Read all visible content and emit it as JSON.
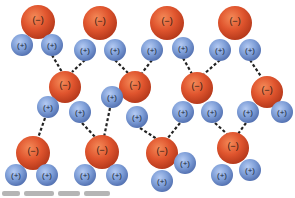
{
  "figure": {
    "labels": {
      "oxygen": "(−)",
      "hydrogen": "(+)"
    },
    "colors": {
      "oxygen_fill": "#e0552e",
      "oxygen_highlight": "#f27a4a",
      "oxygen_shade": "#b73a1c",
      "hydrogen_fill": "#7f9fd8",
      "hydrogen_highlight": "#aac2ee",
      "hydrogen_shade": "#5573b3",
      "bond": "#222222",
      "background": "#ffffff"
    },
    "molecules": [
      {
        "id": "top-1",
        "O": [
          38,
          22,
          17
        ],
        "H": [
          [
            22,
            45,
            11
          ],
          [
            52,
            45,
            11
          ]
        ]
      },
      {
        "id": "top-2",
        "O": [
          100,
          23,
          17
        ],
        "H": [
          [
            85,
            50,
            11
          ],
          [
            115,
            50,
            11
          ]
        ]
      },
      {
        "id": "top-3",
        "O": [
          167,
          23,
          17
        ],
        "H": [
          [
            152,
            50,
            11
          ],
          [
            183,
            48,
            11
          ]
        ]
      },
      {
        "id": "top-4",
        "O": [
          235,
          23,
          17
        ],
        "H": [
          [
            220,
            50,
            11
          ],
          [
            250,
            50,
            11
          ]
        ]
      },
      {
        "id": "mid-1",
        "O": [
          65,
          87,
          16
        ],
        "H": [
          [
            48,
            107,
            11
          ],
          [
            80,
            112,
            11
          ]
        ]
      },
      {
        "id": "mid-2",
        "O": [
          135,
          87,
          16
        ],
        "H": [
          [
            112,
            97,
            11
          ],
          [
            137,
            117,
            11
          ]
        ]
      },
      {
        "id": "mid-3",
        "O": [
          197,
          88,
          16
        ],
        "H": [
          [
            183,
            112,
            11
          ],
          [
            212,
            112,
            11
          ]
        ]
      },
      {
        "id": "mid-4",
        "O": [
          267,
          92,
          16
        ],
        "H": [
          [
            248,
            112,
            11
          ],
          [
            282,
            112,
            11
          ]
        ]
      },
      {
        "id": "bot-1",
        "O": [
          33,
          153,
          17
        ],
        "H": [
          [
            16,
            175,
            11
          ],
          [
            47,
            175,
            11
          ]
        ]
      },
      {
        "id": "bot-2",
        "O": [
          102,
          152,
          17
        ],
        "H": [
          [
            85,
            175,
            11
          ],
          [
            117,
            175,
            11
          ]
        ]
      },
      {
        "id": "bot-3",
        "O": [
          162,
          153,
          16
        ],
        "H": [
          [
            185,
            163,
            11
          ],
          [
            162,
            181,
            11
          ]
        ]
      },
      {
        "id": "bot-4",
        "O": [
          233,
          148,
          16
        ],
        "H": [
          [
            222,
            175,
            11
          ],
          [
            250,
            170,
            11
          ]
        ]
      }
    ],
    "hydrogen_bonds": [
      [
        52,
        55,
        62,
        72
      ],
      [
        85,
        60,
        72,
        72
      ],
      [
        115,
        60,
        128,
        73
      ],
      [
        152,
        60,
        142,
        73
      ],
      [
        183,
        58,
        192,
        74
      ],
      [
        220,
        60,
        204,
        74
      ],
      [
        250,
        60,
        262,
        78
      ],
      [
        45,
        118,
        38,
        138
      ],
      [
        82,
        123,
        96,
        138
      ],
      [
        110,
        108,
        104,
        137
      ],
      [
        140,
        128,
        157,
        139
      ],
      [
        180,
        123,
        167,
        139
      ],
      [
        215,
        123,
        227,
        134
      ],
      [
        246,
        123,
        238,
        134
      ]
    ],
    "caption": {
      "legible": false,
      "segment_widths": [
        18,
        30,
        22,
        26
      ]
    }
  }
}
